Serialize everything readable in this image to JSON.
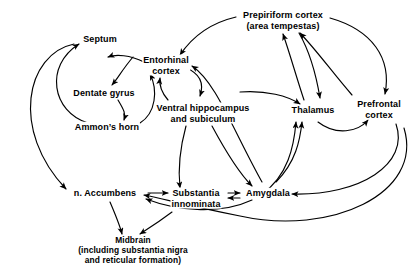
{
  "figure": {
    "background_color": "#ffffff",
    "line_color": "#000000",
    "text_color": "#000000",
    "width": 419,
    "height": 276
  },
  "nodes": [
    {
      "id": "septum",
      "label": "Septum",
      "lines": [
        "Septum"
      ],
      "x": 100,
      "y": 39
    },
    {
      "id": "prepiriform-cortex",
      "label": "Prepiriform cortex (area tempestas)",
      "lines": [
        "Prepiriform cortex",
        "(area tempestas)"
      ],
      "x": 283,
      "y": 20
    },
    {
      "id": "entorhinal-cortex",
      "label": "Entorhinal cortex",
      "lines": [
        "Entorhinal",
        "cortex"
      ],
      "x": 166,
      "y": 65
    },
    {
      "id": "dentate-gyrus",
      "label": "Dentate gyrus",
      "lines": [
        "Dentate gyrus"
      ],
      "x": 104,
      "y": 93
    },
    {
      "id": "ventral-hippocampus",
      "label": "Ventral hippocampus and subiculum",
      "lines": [
        "Ventral hippocampus",
        "and subiculum"
      ],
      "x": 203,
      "y": 113
    },
    {
      "id": "thalamus",
      "label": "Thalamus",
      "lines": [
        "Thalamus"
      ],
      "x": 313,
      "y": 110
    },
    {
      "id": "prefrontal-cortex",
      "label": "Prefrontal cortex",
      "lines": [
        "Prefrontal",
        "cortex"
      ],
      "x": 379,
      "y": 109
    },
    {
      "id": "ammons-horn",
      "label": "Ammon's horn",
      "lines": [
        "Ammon’s horn"
      ],
      "x": 107,
      "y": 127
    },
    {
      "id": "n-accumbens",
      "label": "n. Accumbens",
      "lines": [
        "n. Accumbens"
      ],
      "x": 105,
      "y": 193
    },
    {
      "id": "substantia-innominata",
      "label": "Substantia innominata",
      "lines": [
        "Substantia",
        "innominata"
      ],
      "x": 196,
      "y": 198
    },
    {
      "id": "amygdala",
      "label": "Amygdala",
      "lines": [
        "Amygdala"
      ],
      "x": 268,
      "y": 193
    },
    {
      "id": "midbrain",
      "label": "Midbrain (including substantia nigra and reticular formation)",
      "lines": [
        "Midbrain",
        "(including substantia nigra",
        "and reticular formation)"
      ],
      "x": 133,
      "y": 250
    }
  ],
  "connections": [
    {
      "from": "ammons-horn",
      "to": "septum",
      "style": "curved-arc-left"
    },
    {
      "from": "septum",
      "to": "n-accumbens",
      "style": "curved-arc-far-left"
    },
    {
      "from": "septum",
      "to": "dentate-gyrus",
      "style": "curved"
    },
    {
      "from": "dentate-gyrus",
      "to": "ammons-horn",
      "style": "curved"
    },
    {
      "from": "ammons-horn",
      "to": "entorhinal-cortex",
      "style": "curved"
    },
    {
      "from": "entorhinal-cortex",
      "to": "septum",
      "style": "curved"
    },
    {
      "from": "ventral-hippocampus",
      "to": "entorhinal-cortex",
      "style": "curved"
    },
    {
      "from": "entorhinal-cortex",
      "to": "ventral-hippocampus",
      "style": "curved"
    },
    {
      "from": "amygdala",
      "to": "entorhinal-cortex",
      "style": "long-arc"
    },
    {
      "from": "prepiriform-cortex",
      "to": "entorhinal-cortex",
      "style": "long-arc"
    },
    {
      "from": "thalamus",
      "to": "prepiriform-cortex",
      "style": "curved"
    },
    {
      "from": "prefrontal-cortex",
      "to": "prepiriform-cortex",
      "style": "curved"
    },
    {
      "from": "prepiriform-cortex",
      "to": "thalamus",
      "style": "curved"
    },
    {
      "from": "prepiriform-cortex",
      "to": "prefrontal-cortex",
      "style": "long-arc"
    },
    {
      "from": "ventral-hippocampus",
      "to": "thalamus",
      "style": "curved"
    },
    {
      "from": "amygdala",
      "to": "thalamus",
      "style": "curved-up"
    },
    {
      "from": "substantia-innominata",
      "to": "thalamus",
      "style": "curved-up"
    },
    {
      "from": "thalamus",
      "to": "prefrontal-cortex",
      "style": "curved"
    },
    {
      "from": "ventral-hippocampus",
      "to": "amygdala",
      "style": "curved"
    },
    {
      "from": "ventral-hippocampus",
      "to": "substantia-innominata",
      "style": "curved"
    },
    {
      "from": "prefrontal-cortex",
      "to": "amygdala",
      "style": "long-arc"
    },
    {
      "from": "prefrontal-cortex",
      "to": "n-accumbens",
      "style": "long-arc-bottom"
    },
    {
      "from": "amygdala",
      "to": "n-accumbens",
      "style": "curved"
    },
    {
      "from": "n-accumbens",
      "to": "substantia-innominata",
      "style": "straight"
    },
    {
      "from": "substantia-innominata",
      "to": "amygdala",
      "style": "bidirectional"
    },
    {
      "from": "n-accumbens",
      "to": "midbrain",
      "style": "straight"
    },
    {
      "from": "substantia-innominata",
      "to": "midbrain",
      "style": "straight"
    },
    {
      "from": "amygdala",
      "to": "substantia-innominata",
      "style": "curved-below"
    }
  ]
}
